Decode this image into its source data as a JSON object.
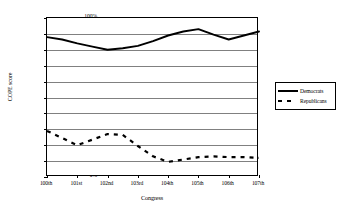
{
  "chart_data": {
    "type": "line",
    "title": "",
    "xlabel": "Congress",
    "ylabel": "COPE score",
    "ylim": [
      0,
      100
    ],
    "ytick_labels": [
      "100%",
      "90%",
      "80%",
      "70%",
      "60%",
      "50%",
      "40%",
      "30%",
      "20%",
      "10%",
      "0%"
    ],
    "ytick_values": [
      100,
      90,
      80,
      70,
      60,
      50,
      40,
      30,
      20,
      10,
      0
    ],
    "grid": true,
    "legend_position": "right-outside",
    "categories": [
      "100th",
      "101st",
      "102nd",
      "103rd",
      "104th",
      "105th",
      "106th",
      "107th"
    ],
    "series": [
      {
        "name": "Democrats",
        "style": "solid",
        "color": "#000000",
        "values": [
          88,
          84,
          80,
          82.5,
          89,
          93,
          86.5,
          91.5
        ]
      },
      {
        "name": "Republicans",
        "style": "dashed",
        "color": "#000000",
        "values": [
          29,
          20,
          27,
          19.5,
          9.5,
          12.5,
          12.5,
          12
        ]
      }
    ],
    "series_detail": [
      {
        "name": "Democrats",
        "x": [
          100,
          100.5,
          101,
          101.5,
          102,
          102.5,
          103,
          103.5,
          104,
          104.5,
          105,
          105.5,
          106,
          106.5,
          107
        ],
        "y": [
          88,
          86.5,
          84,
          82,
          80,
          81,
          82.5,
          85.5,
          89,
          91.5,
          93,
          89.5,
          86.5,
          89,
          91.5
        ]
      },
      {
        "name": "Republicans",
        "x": [
          100,
          100.5,
          101,
          101.5,
          102,
          102.5,
          103,
          103.5,
          104,
          104.5,
          105,
          105.5,
          106,
          106.5,
          107
        ],
        "y": [
          29,
          24.5,
          20,
          23.5,
          27,
          26.5,
          19.5,
          13,
          9.5,
          11,
          12.5,
          13,
          12.5,
          12.5,
          12
        ]
      }
    ]
  },
  "legend": {
    "items": [
      {
        "label": "Democrats",
        "style": "solid"
      },
      {
        "label": "Republicans",
        "style": "dashed"
      }
    ]
  }
}
